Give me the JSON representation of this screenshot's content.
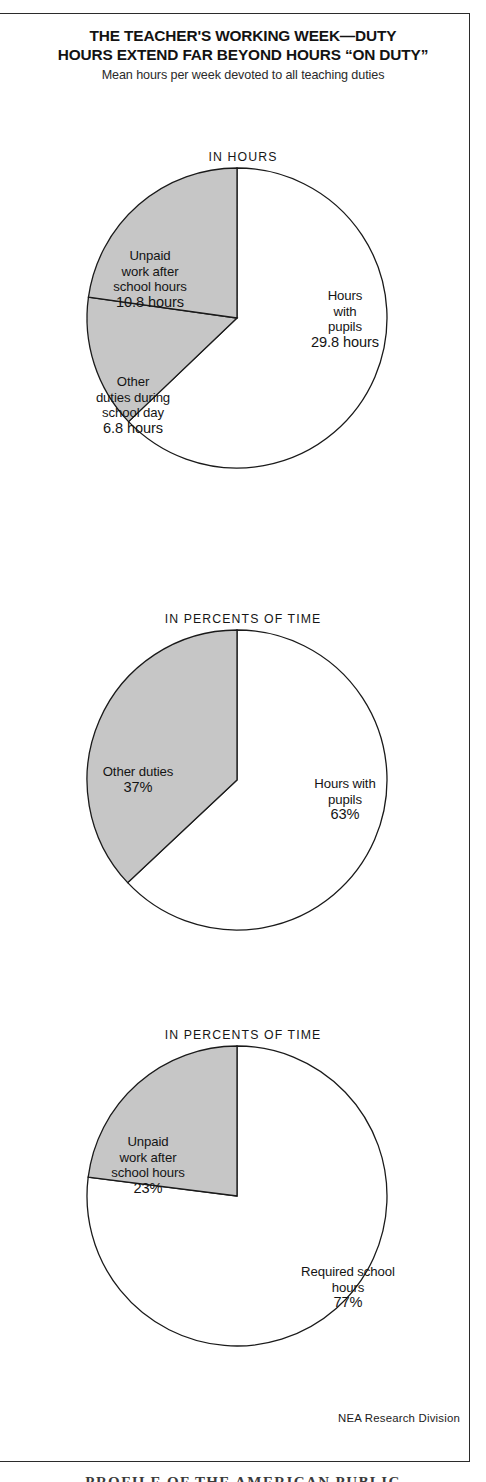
{
  "header": {
    "title_line1": "THE TEACHER'S WORKING WEEK—DUTY",
    "title_line2": "HOURS EXTEND FAR BEYOND HOURS “ON DUTY”",
    "subtitle": "Mean hours per week devoted to all teaching duties"
  },
  "credit": "NEA Research Division",
  "bleed_caption": "PROFILE OF THE AMERICAN PUBLIC",
  "colors": {
    "shaded_slice": "#c6c6c6",
    "white_slice": "#ffffff",
    "outline": "#1a1a1a",
    "frame": "#2b2b2b",
    "text": "#141414"
  },
  "chart_data": [
    {
      "type": "pie",
      "id": "pie-in-hours",
      "title": "IN HOURS",
      "unit": "hours",
      "total": 47.4,
      "slices": [
        {
          "name": "Hours with pupils",
          "label": "Hours\nwith\npupils",
          "value_text": "29.8 hours",
          "value": 29.8,
          "shaded": false,
          "start_deg": 0,
          "end_deg": 226.3
        },
        {
          "name": "Other duties during school day",
          "label": "Other\nduties during\nschool day",
          "value_text": "6.8 hours",
          "value": 6.8,
          "shaded": true,
          "start_deg": 226.3,
          "end_deg": 278.0
        },
        {
          "name": "Unpaid work after school hours",
          "label": "Unpaid\nwork after\nschool hours",
          "value_text": "10.8 hours",
          "value": 10.8,
          "shaded": true,
          "start_deg": 278.0,
          "end_deg": 360
        }
      ]
    },
    {
      "type": "pie",
      "id": "pie-percent-duties",
      "title": "IN PERCENTS OF TIME",
      "unit": "%",
      "total": 100,
      "slices": [
        {
          "name": "Hours with pupils",
          "label": "Hours with\npupils",
          "value_text": "63%",
          "value": 63,
          "shaded": false,
          "start_deg": 0,
          "end_deg": 226.8
        },
        {
          "name": "Other duties",
          "label": "Other duties",
          "value_text": "37%",
          "value": 37,
          "shaded": true,
          "start_deg": 226.8,
          "end_deg": 360
        }
      ]
    },
    {
      "type": "pie",
      "id": "pie-percent-unpaid",
      "title": "IN PERCENTS OF TIME",
      "unit": "%",
      "total": 100,
      "slices": [
        {
          "name": "Required school hours",
          "label": "Required school\nhours",
          "value_text": "77%",
          "value": 77,
          "shaded": false,
          "start_deg": 0,
          "end_deg": 277.2
        },
        {
          "name": "Unpaid work after school hours",
          "label": "Unpaid\nwork after\nschool hours",
          "value_text": "23%",
          "value": 23,
          "shaded": true,
          "start_deg": 277.2,
          "end_deg": 360
        }
      ]
    }
  ]
}
